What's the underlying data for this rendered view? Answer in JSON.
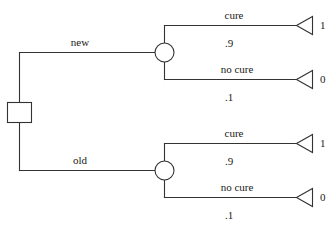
{
  "diagram": {
    "type": "decision-tree",
    "title": "",
    "colors": {
      "line": "#333333",
      "text": "#1a1a1a",
      "background": "#ffffff"
    },
    "root": {
      "node_name": "decision-node",
      "shape": "square"
    },
    "branches": [
      {
        "id": "new",
        "label": "new",
        "chance_node": "chance-node-new",
        "outcomes": [
          {
            "id": "new-cure",
            "label": "cure",
            "probability": ".9",
            "payoff": "1"
          },
          {
            "id": "new-no-cure",
            "label": "no cure",
            "probability": ".1",
            "payoff": "0"
          }
        ]
      },
      {
        "id": "old",
        "label": "old",
        "chance_node": "chance-node-old",
        "outcomes": [
          {
            "id": "old-cure",
            "label": "cure",
            "probability": ".9",
            "payoff": "1"
          },
          {
            "id": "old-no-cure",
            "label": "no cure",
            "probability": ".1",
            "payoff": "0"
          }
        ]
      }
    ]
  },
  "labels": {
    "branch_new": "new",
    "branch_old": "old",
    "new_cure": "cure",
    "new_cure_prob": ".9",
    "new_cure_payoff": "1",
    "new_nocure": "no cure",
    "new_nocure_prob": ".1",
    "new_nocure_payoff": "0",
    "old_cure": "cure",
    "old_cure_prob": ".9",
    "old_cure_payoff": "1",
    "old_nocure": "no cure",
    "old_nocure_prob": ".1",
    "old_nocure_payoff": "0"
  }
}
